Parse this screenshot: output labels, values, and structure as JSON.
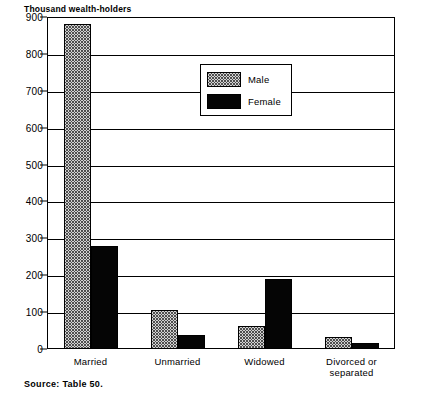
{
  "chart_data": {
    "type": "bar",
    "title": "",
    "subtitle": "",
    "ylabel": "Thousand wealth-holders",
    "xlabel": "",
    "ylim": [
      0,
      900
    ],
    "ytick_step": 100,
    "yticks": [
      "900",
      "800",
      "700",
      "600",
      "500",
      "400",
      "300",
      "200",
      "100",
      "0"
    ],
    "grid": true,
    "legend_position": "inside-top-center",
    "categories": [
      "Married",
      "Unmarried",
      "Widowed",
      "Divorced or separated"
    ],
    "series": [
      {
        "name": "Male",
        "values": [
          880,
          105,
          63,
          32
        ]
      },
      {
        "name": "Female",
        "values": [
          280,
          38,
          190,
          15
        ]
      }
    ],
    "annotations": [
      "Source: Table 50."
    ]
  },
  "legend": {
    "items": [
      {
        "label": "Male",
        "swatch": "dotted-gray-pattern"
      },
      {
        "label": "Female",
        "swatch": "solid-black"
      }
    ]
  },
  "source": {
    "text": "Source: Table 50."
  },
  "colors": {
    "male_fill": "#d2d2d2",
    "male_dot": "#4a4a4a",
    "female_fill": "#050505",
    "axis": "#000000",
    "background": "#ffffff"
  }
}
